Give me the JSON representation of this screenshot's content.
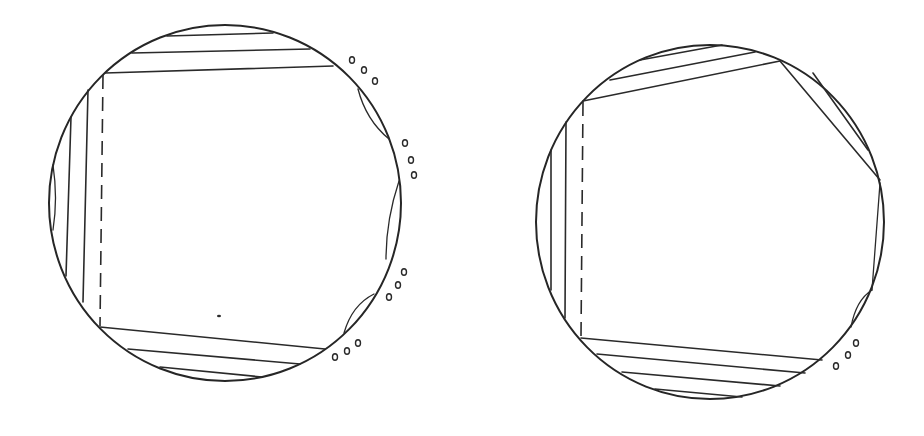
{
  "figure": {
    "panels": [
      {
        "id": "left",
        "label": "",
        "top_chord_count": 3,
        "left_vertical_cut_count": 2,
        "bottom_chord_count": 3,
        "right_lens_count": 3,
        "ellipse_marker_groups": 4,
        "has_dashed_boundary": true
      },
      {
        "id": "right",
        "label": "",
        "top_chord_count": 3,
        "left_vertical_cut_count": 2,
        "bottom_chord_count": 4,
        "right_diagonal_cut": true,
        "right_lens_count": 3,
        "ellipse_marker_groups": 1,
        "has_dashed_boundary": true
      }
    ],
    "colors": {
      "line": "#2a2a2a",
      "background": "#ffffff"
    }
  }
}
